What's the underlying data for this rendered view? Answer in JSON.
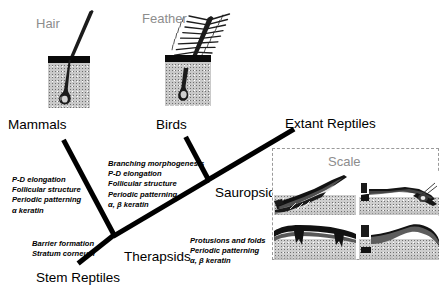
{
  "figure": {
    "title_present": false,
    "type": "phylogenetic-tree-diagram",
    "background_color": "#ffffff",
    "line_color": "#000000",
    "gray_label_color": "#8d8d8d"
  },
  "structures": [
    {
      "id": "hair",
      "label": "Hair",
      "taxon": "Mammals"
    },
    {
      "id": "feather",
      "label": "Feather",
      "taxon": "Birds"
    },
    {
      "id": "scale",
      "label": "Scale",
      "taxon": "Extant Reptiles"
    }
  ],
  "taxa": [
    {
      "id": "mammals",
      "label": "Mammals"
    },
    {
      "id": "birds",
      "label": "Birds"
    },
    {
      "id": "extant_reptiles",
      "label": "Extant Reptiles"
    },
    {
      "id": "sauropsids",
      "label": "Sauropsids"
    },
    {
      "id": "therapsids",
      "label": "Therapsids"
    },
    {
      "id": "stem_reptiles",
      "label": "Stem Reptiles"
    }
  ],
  "character_sets": [
    {
      "id": "mammal-characters",
      "branch": "therapsids-to-mammals",
      "lines": [
        "P-D elongation",
        "Follicular structure",
        "Periodic patterning",
        "α keratin"
      ]
    },
    {
      "id": "bird-characters",
      "branch": "sauropsids-to-birds",
      "lines": [
        "Branching morphogenesis",
        "P-D elongation",
        "Follicular structure",
        "Periodic patterning",
        "α, β keratin"
      ]
    },
    {
      "id": "stem-reptile-characters",
      "branch": "stem-reptiles-root",
      "lines": [
        "Barrier formation",
        "Stratum corneum"
      ]
    },
    {
      "id": "reptile-characters",
      "branch": "sauropsids-to-extant-reptiles",
      "lines": [
        "Protusions and folds",
        "Periodic patterning",
        "α, β keratin"
      ]
    }
  ],
  "scale_box": {
    "label": "Scale",
    "border_style": "dashed",
    "border_color": "#9a9a9a",
    "panel_count": 4,
    "panels": [
      {
        "id": "scale-panel-top-left",
        "description": "overlapping keratinized scale, sagittal section"
      },
      {
        "id": "scale-panel-top-right",
        "description": "scale hinge region with bristle, sagittal section"
      },
      {
        "id": "scale-panel-bottom-left",
        "description": "flattened tuberculate scale, sagittal section"
      },
      {
        "id": "scale-panel-bottom-right",
        "description": "raised overlapping scale, sagittal section"
      }
    ]
  }
}
